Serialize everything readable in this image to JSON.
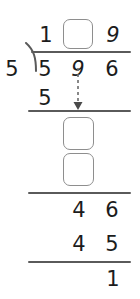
{
  "problem": {
    "type": "long-division-worksheet",
    "divisor": "5",
    "dividend": "596",
    "quotient_digits": [
      "1",
      "",
      "9"
    ],
    "remainder": "1",
    "ink_color": "#1c1c1c",
    "rule_color": "#5a5a5a",
    "box_color": "#8e8e8e"
  },
  "quotient_row": {
    "tens": "1",
    "ones_box_placeholder": "",
    "units": "9"
  },
  "dividend_row": {
    "divisor": "5",
    "d1": "5",
    "d2": "9",
    "d3": "6"
  },
  "step1_row": {
    "value": "5"
  },
  "step2_boxes": {
    "box_upper_placeholder": "",
    "box_lower_placeholder": ""
  },
  "step3_row": {
    "tens": "4",
    "ones": "6"
  },
  "step4_row": {
    "tens": "4",
    "ones": "5"
  },
  "remainder_row": {
    "value": "1"
  },
  "annotations": {
    "bring_down_arrow": "dashed-down-arrow"
  }
}
